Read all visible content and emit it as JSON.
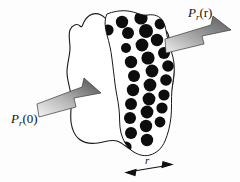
{
  "figure": {
    "background_color": "#fdfdfd",
    "ink_color": "#111111",
    "scatterer_color": "#0d0d0d",
    "arrow_dark": "#4f4f4f",
    "arrow_light": "#f2f2f2",
    "outline_color": "#1a1a1a"
  },
  "labels": {
    "incident_power": {
      "base": "P",
      "sub": "r",
      "arg": "(0)",
      "full": "P_r(0)"
    },
    "transmitted_power": {
      "base": "P",
      "sub": "r",
      "arg": "(r)",
      "full": "P_r(r)"
    },
    "thickness": {
      "full": "r"
    }
  },
  "arrows": {
    "incident": {
      "name": "incident-power-arrow",
      "direction": "right-up",
      "shading": "gradient-light-to-dark"
    },
    "transmitted": {
      "name": "transmitted-power-arrow",
      "direction": "right-up",
      "shading": "gradient-light-to-dark"
    },
    "dimension": {
      "name": "thickness-dimension-arrow",
      "direction": "double-headed-horizontal"
    }
  },
  "medium": {
    "name": "irregular-medium-outline",
    "scatterer_band": {
      "name": "scatterer-band",
      "count": 28,
      "shape": "filled-circle"
    }
  },
  "scatterers": [
    {
      "cx": 122,
      "cy": 22,
      "r": 6.2
    },
    {
      "cx": 141,
      "cy": 18,
      "r": 6.6
    },
    {
      "cx": 128,
      "cy": 33,
      "r": 6.0
    },
    {
      "cx": 146,
      "cy": 31,
      "r": 7.0
    },
    {
      "cx": 160,
      "cy": 24,
      "r": 5.4
    },
    {
      "cx": 108,
      "cy": 30,
      "r": 5.6
    },
    {
      "cx": 142,
      "cy": 45,
      "r": 6.4
    },
    {
      "cx": 157,
      "cy": 40,
      "r": 6.2
    },
    {
      "cx": 126,
      "cy": 48,
      "r": 5.0
    },
    {
      "cx": 148,
      "cy": 58,
      "r": 6.6
    },
    {
      "cx": 164,
      "cy": 53,
      "r": 6.0
    },
    {
      "cx": 131,
      "cy": 62,
      "r": 6.2
    },
    {
      "cx": 152,
      "cy": 71,
      "r": 6.4
    },
    {
      "cx": 168,
      "cy": 66,
      "r": 5.8
    },
    {
      "cx": 134,
      "cy": 76,
      "r": 6.0
    },
    {
      "cx": 150,
      "cy": 85,
      "r": 6.4
    },
    {
      "cx": 166,
      "cy": 80,
      "r": 5.8
    },
    {
      "cx": 133,
      "cy": 90,
      "r": 6.2
    },
    {
      "cx": 149,
      "cy": 99,
      "r": 6.4
    },
    {
      "cx": 164,
      "cy": 95,
      "r": 5.6
    },
    {
      "cx": 131,
      "cy": 104,
      "r": 6.0
    },
    {
      "cx": 147,
      "cy": 112,
      "r": 6.4
    },
    {
      "cx": 162,
      "cy": 108,
      "r": 5.6
    },
    {
      "cx": 130,
      "cy": 118,
      "r": 6.0
    },
    {
      "cx": 146,
      "cy": 126,
      "r": 6.2
    },
    {
      "cx": 160,
      "cy": 122,
      "r": 5.4
    },
    {
      "cx": 131,
      "cy": 133,
      "r": 6.0
    },
    {
      "cx": 147,
      "cy": 140,
      "r": 6.2
    },
    {
      "cx": 126,
      "cy": 147,
      "r": 5.6
    }
  ]
}
